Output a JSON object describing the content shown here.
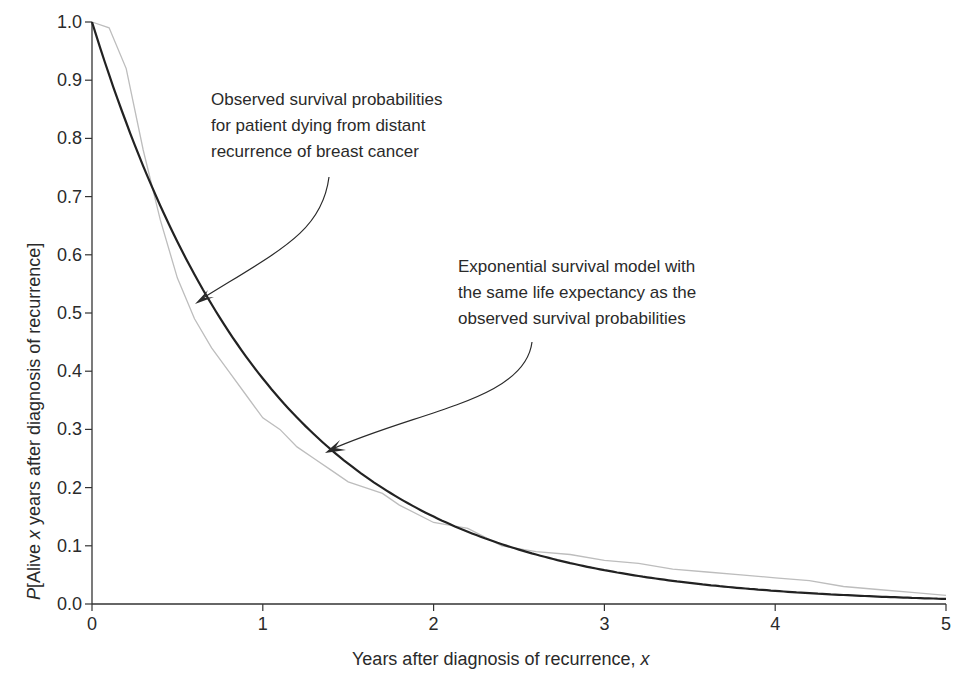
{
  "chart_data": {
    "type": "line",
    "title": "",
    "xlabel": "Years after diagnosis of recurrence, x",
    "xlabel_parts": {
      "text": "Years after diagnosis of recurrence, ",
      "var": "x"
    },
    "ylabel": "P[Alive x years after diagnosis of recurrence]",
    "ylabel_parts": {
      "p": "P",
      "pre": "[Alive ",
      "var": "x",
      "post": " years after diagnosis of recurrence]"
    },
    "xlim": [
      0,
      5
    ],
    "ylim": [
      0,
      1.0
    ],
    "xticks": [
      0,
      1,
      2,
      3,
      4,
      5
    ],
    "xtick_labels": [
      "0",
      "1",
      "2",
      "3",
      "4",
      "5"
    ],
    "yticks": [
      0,
      0.1,
      0.2,
      0.3,
      0.4,
      0.5,
      0.6,
      0.7,
      0.8,
      0.9,
      1.0
    ],
    "ytick_labels": [
      "0.0",
      "0.1",
      "0.2",
      "0.3",
      "0.4",
      "0.5",
      "0.6",
      "0.7",
      "0.8",
      "0.9",
      "1.0"
    ],
    "grid": false,
    "legend": "none (inline annotations)",
    "series": [
      {
        "name": "Observed survival probabilities for patient dying from distant recurrence of breast cancer",
        "style": "thin light gray",
        "color": "#bdbdbd",
        "x": [
          0,
          0.1,
          0.2,
          0.3,
          0.4,
          0.5,
          0.6,
          0.7,
          0.8,
          0.9,
          1.0,
          1.1,
          1.2,
          1.3,
          1.4,
          1.5,
          1.6,
          1.7,
          1.8,
          2.0,
          2.2,
          2.4,
          2.6,
          2.8,
          3.0,
          3.2,
          3.4,
          3.6,
          3.8,
          4.0,
          4.2,
          4.4,
          4.6,
          4.8,
          5.0
        ],
        "y": [
          1.0,
          0.99,
          0.92,
          0.78,
          0.66,
          0.56,
          0.49,
          0.44,
          0.4,
          0.36,
          0.32,
          0.3,
          0.27,
          0.25,
          0.23,
          0.21,
          0.2,
          0.19,
          0.17,
          0.14,
          0.13,
          0.1,
          0.09,
          0.085,
          0.075,
          0.07,
          0.06,
          0.055,
          0.05,
          0.045,
          0.04,
          0.03,
          0.025,
          0.02,
          0.015
        ]
      },
      {
        "name": "Exponential survival model with the same life expectancy as the observed survival probabilities",
        "style": "thick dark",
        "color": "#222222",
        "x": [
          0,
          0.25,
          0.5,
          0.75,
          1.0,
          1.25,
          1.5,
          1.75,
          2.0,
          2.5,
          3.0,
          3.5,
          4.0,
          4.5,
          5.0
        ],
        "y": [
          1.0,
          0.79,
          0.62,
          0.49,
          0.39,
          0.305,
          0.24,
          0.19,
          0.15,
          0.093,
          0.058,
          0.036,
          0.022,
          0.014,
          0.009
        ]
      }
    ],
    "annotations": [
      {
        "lines": [
          "Observed survival probabilities",
          "for patient dying from distant",
          "recurrence of breast cancer"
        ],
        "arrow_to": {
          "x": 0.62,
          "y": 0.52
        }
      },
      {
        "lines": [
          "Exponential survival model with",
          "the same life expectancy as the",
          "observed survival probabilities"
        ],
        "arrow_to": {
          "x": 1.37,
          "y": 0.26
        }
      }
    ]
  },
  "colors": {
    "axis": "#333333",
    "observed": "#bdbdbd",
    "model": "#222222",
    "arrow": "#2a2a2a",
    "background": "#ffffff"
  }
}
